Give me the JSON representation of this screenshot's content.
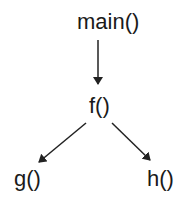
{
  "diagram": {
    "type": "call-graph",
    "nodes": [
      {
        "id": "main",
        "label": "main()"
      },
      {
        "id": "f",
        "label": "f()"
      },
      {
        "id": "g",
        "label": "g()"
      },
      {
        "id": "h",
        "label": "h()"
      }
    ],
    "edges": [
      {
        "from": "main",
        "to": "f"
      },
      {
        "from": "f",
        "to": "g"
      },
      {
        "from": "f",
        "to": "h"
      }
    ],
    "colors": {
      "text": "#1a1a1a",
      "edge": "#222222",
      "background": "#ffffff"
    }
  }
}
